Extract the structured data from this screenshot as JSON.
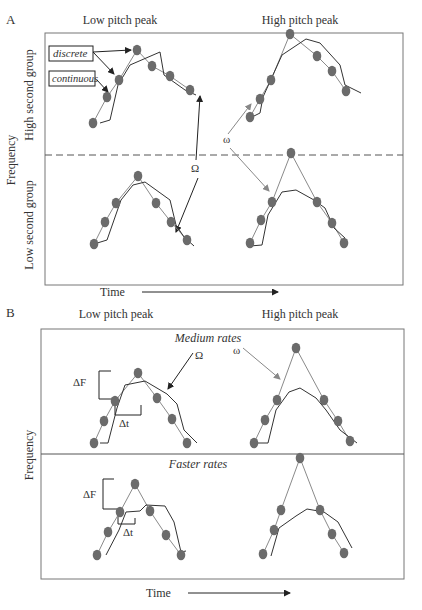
{
  "panel_a": {
    "letter": "A",
    "col_low": "Low pitch peak",
    "col_high": "High pitch peak",
    "y_axis": "Frequency",
    "row_high": "High second group",
    "row_low": "Low second group",
    "x_axis": "Time",
    "callout_discrete": "discrete",
    "callout_continuous": "continuous",
    "omega_upper": "Ω",
    "omega_lower": "ω"
  },
  "panel_b": {
    "letter": "B",
    "col_low": "Low pitch peak",
    "col_high": "High pitch peak",
    "y_axis": "Frequency",
    "row_medium": "Medium rates",
    "row_faster": "Faster rates",
    "x_axis": "Time",
    "omega_upper": "Ω",
    "omega_lower": "ω",
    "delta_f": "ΔF",
    "delta_t": "Δt"
  },
  "colors": {
    "dot": "#6b6b6b",
    "discrete_line": "#8a8a8a",
    "continuous_line": "#333333",
    "frame": "#777777"
  },
  "chart_data": {
    "type": "diagram",
    "panels": [
      {
        "panel": "A",
        "cells": [
          {
            "row": "High second group",
            "col": "Low pitch peak",
            "dots": 7
          },
          {
            "row": "High second group",
            "col": "High pitch peak",
            "dots": 7
          },
          {
            "row": "Low second group",
            "col": "Low pitch peak",
            "dots": 7
          },
          {
            "row": "Low second group",
            "col": "High pitch peak",
            "dots": 7
          }
        ]
      },
      {
        "panel": "B",
        "cells": [
          {
            "row": "Medium rates",
            "col": "Low pitch peak",
            "dots": 7
          },
          {
            "row": "Medium rates",
            "col": "High pitch peak",
            "dots": 7
          },
          {
            "row": "Faster rates",
            "col": "Low pitch peak",
            "dots": 7
          },
          {
            "row": "Faster rates",
            "col": "High pitch peak",
            "dots": 7
          }
        ]
      }
    ]
  }
}
